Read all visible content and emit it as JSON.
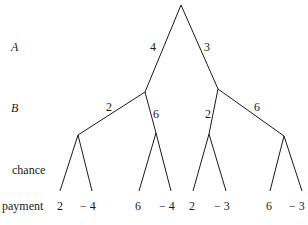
{
  "diagram": {
    "type": "game-tree",
    "row_labels": {
      "A": "A",
      "B": "B",
      "chance": "chance",
      "payment": "payment"
    },
    "edges": {
      "root_left": "4",
      "root_right": "3",
      "left_left": "2",
      "left_right": "6",
      "right_left": "2",
      "right_right": "6"
    },
    "payments": [
      "2",
      "− 4",
      "6",
      "− 4",
      "2",
      "− 3",
      "6",
      "− 3"
    ],
    "line_color": "#1a1a1a"
  }
}
